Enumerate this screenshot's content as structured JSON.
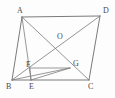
{
  "figure": {
    "background_color": "#fdfdfd",
    "line_color": "#6b6b6b",
    "label_color": "#4a4a4a",
    "width": 115,
    "height": 98,
    "points": {
      "A": {
        "label": "A",
        "x": 22,
        "y": 17,
        "label_x": 17,
        "label_y": 11
      },
      "B": {
        "label": "B",
        "x": 12,
        "y": 80,
        "label_x": 6,
        "label_y": 87
      },
      "C": {
        "label": "C",
        "x": 89,
        "y": 80,
        "label_x": 88,
        "label_y": 87
      },
      "D": {
        "label": "D",
        "x": 100,
        "y": 16,
        "label_x": 103,
        "label_y": 11
      },
      "E": {
        "label": "E",
        "x": 31,
        "y": 80,
        "label_x": 29,
        "label_y": 87
      },
      "F": {
        "label": "F",
        "x": 30,
        "y": 68,
        "label_x": 26,
        "label_y": 65
      },
      "G": {
        "label": "G",
        "x": 70,
        "y": 68,
        "label_x": 73,
        "label_y": 64
      },
      "O": {
        "label": "O",
        "x": 58,
        "y": 41,
        "label_x": 57,
        "label_y": 37
      }
    },
    "segments": [
      {
        "name": "side-AD",
        "from": "A",
        "to": "D",
        "kind": "edge"
      },
      {
        "name": "side-AB",
        "from": "A",
        "to": "B",
        "kind": "edge"
      },
      {
        "name": "side-BC",
        "from": "B",
        "to": "C",
        "kind": "edge"
      },
      {
        "name": "side-DC",
        "from": "D",
        "to": "C",
        "kind": "edge"
      },
      {
        "name": "diagonal-AC",
        "from": "A",
        "to": "C",
        "kind": "diagonal"
      },
      {
        "name": "diagonal-BD",
        "from": "B",
        "to": "D",
        "kind": "diagonal"
      },
      {
        "name": "cevian-AE",
        "from": "A",
        "to": "E",
        "kind": "cevian"
      },
      {
        "name": "cevian-BG",
        "from": "B",
        "to": "G",
        "kind": "cevian"
      },
      {
        "name": "segment-FG",
        "from": "F",
        "to": "G",
        "kind": "cevian"
      },
      {
        "name": "segment-EF",
        "from": "E",
        "to": "F",
        "kind": "cevian"
      },
      {
        "name": "segment-EG",
        "from": "E",
        "to": "G",
        "kind": "cevian"
      }
    ]
  }
}
